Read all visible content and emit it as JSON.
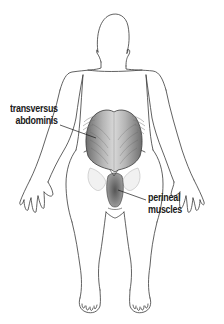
{
  "diagram": {
    "labels": [
      {
        "id": "transversus-abdominis",
        "lines": [
          "transversus",
          "abdominis"
        ]
      },
      {
        "id": "perineal-muscles",
        "lines": [
          "perineal",
          "muscles"
        ]
      }
    ],
    "colors": {
      "outline": "#3a3a3a",
      "muscle_shade": "#8a8a8a",
      "label_text": "#1a1a1a",
      "background": "#ffffff"
    }
  }
}
